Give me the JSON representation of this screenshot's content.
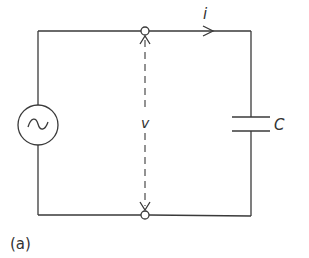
{
  "figure": {
    "caption": "(a)"
  },
  "labels": {
    "current": "i",
    "voltage": "v",
    "capacitor": "C"
  },
  "components": [
    {
      "type": "ac-voltage-source",
      "symbol": "~"
    },
    {
      "type": "capacitor",
      "label": "C"
    },
    {
      "type": "terminal",
      "position": "top"
    },
    {
      "type": "terminal",
      "position": "bottom"
    }
  ],
  "colors": {
    "line": "#3a3a3a",
    "text": "#333333",
    "background": "#ffffff"
  }
}
